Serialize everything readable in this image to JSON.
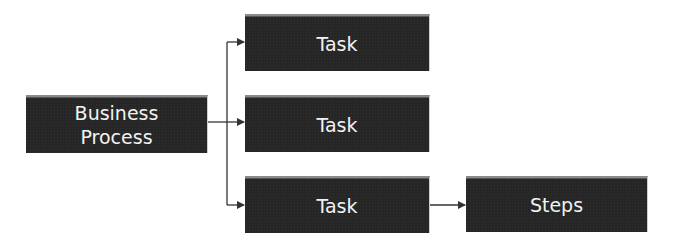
{
  "diagram": {
    "root": {
      "label_line1": "Business",
      "label_line2": "Process"
    },
    "tasks": [
      {
        "label": "Task"
      },
      {
        "label": "Task"
      },
      {
        "label": "Task"
      }
    ],
    "steps": {
      "label": "Steps"
    },
    "colors": {
      "box_fill": "#262626",
      "text": "#f2f2f2",
      "connector": "#333333"
    }
  }
}
